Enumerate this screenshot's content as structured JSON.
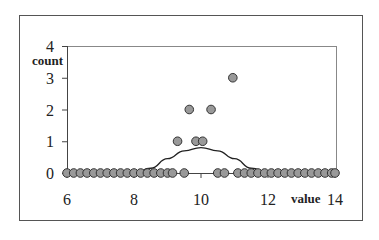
{
  "chart_data": {
    "type": "scatter",
    "title": "",
    "xlabel": "value",
    "ylabel": "count",
    "xlim": [
      6,
      14
    ],
    "ylim": [
      0,
      4
    ],
    "x_ticks": [
      6,
      8,
      10,
      12,
      14
    ],
    "y_ticks": [
      0,
      1,
      2,
      3,
      4
    ],
    "grid": false,
    "legend": null,
    "series": [
      {
        "name": "points",
        "type": "scatter",
        "marker": "circle",
        "color": "#999999",
        "edge_color": "#333333",
        "points": [
          [
            6.0,
            0
          ],
          [
            6.2,
            0
          ],
          [
            6.4,
            0
          ],
          [
            6.6,
            0
          ],
          [
            6.8,
            0
          ],
          [
            7.0,
            0
          ],
          [
            7.2,
            0
          ],
          [
            7.4,
            0
          ],
          [
            7.6,
            0
          ],
          [
            7.8,
            0
          ],
          [
            8.0,
            0
          ],
          [
            8.2,
            0
          ],
          [
            8.4,
            0
          ],
          [
            8.6,
            0
          ],
          [
            8.8,
            0
          ],
          [
            9.0,
            0
          ],
          [
            9.15,
            0
          ],
          [
            9.5,
            0
          ],
          [
            10.5,
            0
          ],
          [
            10.7,
            0
          ],
          [
            11.1,
            0
          ],
          [
            11.3,
            0
          ],
          [
            11.5,
            0
          ],
          [
            11.7,
            0
          ],
          [
            11.9,
            0
          ],
          [
            12.1,
            0
          ],
          [
            12.3,
            0
          ],
          [
            12.5,
            0
          ],
          [
            12.7,
            0
          ],
          [
            12.9,
            0
          ],
          [
            13.1,
            0
          ],
          [
            13.3,
            0
          ],
          [
            13.5,
            0
          ],
          [
            13.7,
            0
          ],
          [
            13.9,
            0
          ],
          [
            14.0,
            0
          ],
          [
            9.3,
            1
          ],
          [
            9.85,
            1
          ],
          [
            10.05,
            1
          ],
          [
            9.65,
            2
          ],
          [
            10.3,
            2
          ],
          [
            10.95,
            3
          ]
        ]
      },
      {
        "name": "density curve",
        "type": "line",
        "color": "#222222",
        "x": [
          8.0,
          8.5,
          9.0,
          9.5,
          10.0,
          10.5,
          11.0,
          11.5,
          12.0
        ],
        "y": [
          0.0,
          0.15,
          0.45,
          0.7,
          0.8,
          0.7,
          0.45,
          0.15,
          0.0
        ]
      }
    ]
  },
  "labels": {
    "x_ticks": [
      "6",
      "8",
      "10",
      "12",
      "14"
    ],
    "y_ticks": [
      "0",
      "1",
      "2",
      "3",
      "4"
    ],
    "xlabel": "value",
    "ylabel": "count"
  }
}
